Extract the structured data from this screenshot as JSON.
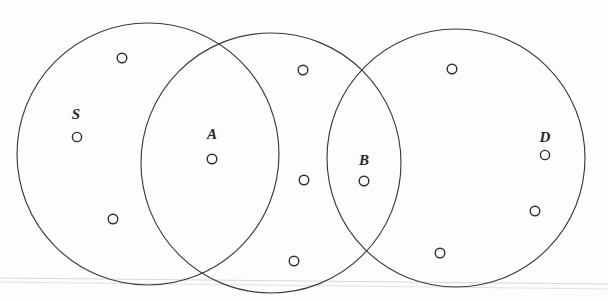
{
  "figure": {
    "background_color": "#fdfdfd",
    "stroke_color": "#3a3a42",
    "node_stroke_color": "#2e2e34",
    "width": 608,
    "height": 301
  },
  "circles": [
    {
      "id": "circle-left",
      "cx": 148,
      "cy": 154,
      "r": 131
    },
    {
      "id": "circle-middle",
      "cx": 271,
      "cy": 163,
      "r": 130
    },
    {
      "id": "circle-right",
      "cx": 456,
      "cy": 158,
      "r": 129
    }
  ],
  "labels": [
    {
      "id": "label-s",
      "text": "S",
      "x": 76,
      "y": 114
    },
    {
      "id": "label-a",
      "text": "A",
      "x": 212,
      "y": 134
    },
    {
      "id": "label-b",
      "text": "B",
      "x": 364,
      "y": 160
    },
    {
      "id": "label-d",
      "text": "D",
      "x": 545,
      "y": 137
    }
  ],
  "nodes": [
    {
      "id": "node-s",
      "label": "S",
      "cx": 77,
      "cy": 137,
      "r": 4.6
    },
    {
      "id": "node-a",
      "label": "A",
      "cx": 212,
      "cy": 159,
      "r": 4.8
    },
    {
      "id": "node-b",
      "label": "B",
      "cx": 364,
      "cy": 181,
      "r": 4.8
    },
    {
      "id": "node-d",
      "label": "D",
      "cx": 545,
      "cy": 155,
      "r": 4.6
    },
    {
      "id": "node-1",
      "label": "",
      "cx": 122,
      "cy": 58,
      "r": 4.8
    },
    {
      "id": "node-2",
      "label": "",
      "cx": 113,
      "cy": 219,
      "r": 4.8
    },
    {
      "id": "node-3",
      "label": "",
      "cx": 303,
      "cy": 70,
      "r": 4.8
    },
    {
      "id": "node-4",
      "label": "",
      "cx": 304,
      "cy": 180,
      "r": 4.8
    },
    {
      "id": "node-5",
      "label": "",
      "cx": 294,
      "cy": 261,
      "r": 4.8
    },
    {
      "id": "node-6",
      "label": "",
      "cx": 452,
      "cy": 69,
      "r": 4.8
    },
    {
      "id": "node-7",
      "label": "",
      "cx": 535,
      "cy": 211,
      "r": 4.8
    },
    {
      "id": "node-8",
      "label": "",
      "cx": 440,
      "cy": 253,
      "r": 4.8
    }
  ],
  "artifacts": [
    {
      "id": "scan-line-top",
      "x1": 0,
      "y1": 278,
      "x2": 608,
      "y2": 284,
      "color": "#d8d8d8"
    },
    {
      "id": "scan-line-bottom",
      "x1": 0,
      "y1": 282,
      "x2": 608,
      "y2": 289,
      "color": "#e2e2e2"
    }
  ]
}
